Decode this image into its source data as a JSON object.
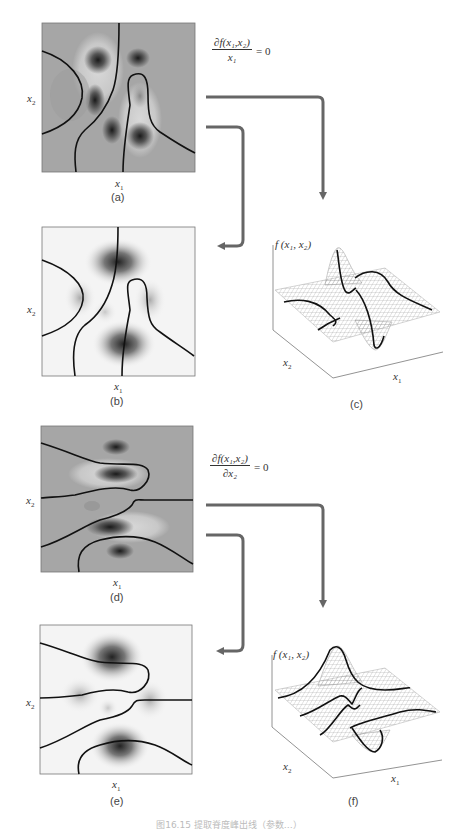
{
  "figure": {
    "caption": "图16.15  提取脊度峰出线（参数…）",
    "arrow_color": "#666666",
    "curve_color": "#111111"
  },
  "equations": {
    "top": {
      "numerator": "∂f(x₁,x₂)",
      "denominator": "x₁",
      "rhs": "= 0"
    },
    "bottom": {
      "numerator": "∂f(x₁,x₂)",
      "denominator": "∂x₂",
      "rhs": "= 0"
    }
  },
  "panels": [
    {
      "id": "a",
      "label": "(a)",
      "xlabel": "x",
      "xsub": "1",
      "ylabel": "x",
      "ysub": "2",
      "background": "#a6a6a6",
      "style": "gray-contour"
    },
    {
      "id": "b",
      "label": "(b)",
      "xlabel": "x",
      "xsub": "1",
      "ylabel": "x",
      "ysub": "2",
      "background": "#f4f4f4",
      "style": "white-contour"
    },
    {
      "id": "c",
      "label": "(c)",
      "zlabel": "f (x₁, x₂)",
      "xlabel": "x",
      "xsub": "1",
      "ylabel": "x",
      "ysub": "2",
      "style": "3d-mesh"
    },
    {
      "id": "d",
      "label": "(d)",
      "xlabel": "x",
      "xsub": "1",
      "ylabel": "x",
      "ysub": "2",
      "background": "#a6a6a6",
      "style": "gray-contour"
    },
    {
      "id": "e",
      "label": "(e)",
      "xlabel": "x",
      "xsub": "1",
      "ylabel": "x",
      "ysub": "2",
      "background": "#f4f4f4",
      "style": "white-contour"
    },
    {
      "id": "f",
      "label": "(f)",
      "zlabel": "f (x₁, x₂)",
      "xlabel": "x",
      "xsub": "1",
      "ylabel": "x",
      "ysub": "2",
      "style": "3d-mesh"
    }
  ]
}
